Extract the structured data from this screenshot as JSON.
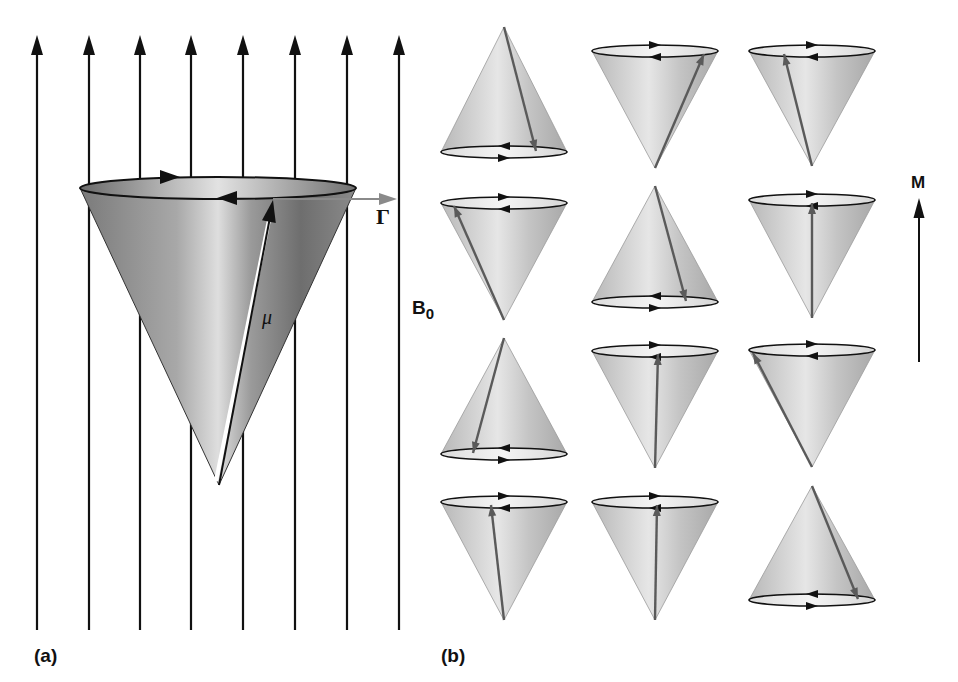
{
  "figure": {
    "panel_a": {
      "label": "(a)",
      "field_label": "B",
      "field_subscript": "0",
      "moment_label": "μ",
      "torque_label": "Γ",
      "field_lines_x": [
        37,
        89,
        140,
        191,
        243,
        295,
        347,
        399
      ],
      "field_line_top": 35,
      "field_line_bottom": 630,
      "cone": {
        "rim_cx": 218,
        "rim_cy": 188,
        "rim_rx": 138,
        "rim_ry": 11,
        "apex_x": 219,
        "apex_y": 485,
        "mu_tip_x": 273,
        "mu_tip_y": 198,
        "torque_end_x": 397
      }
    },
    "panel_b": {
      "label": "(b)",
      "net_label": "M",
      "cones": [
        {
          "id": "r1c1",
          "cx": 504,
          "orientation": "apex-up",
          "top": 27,
          "bottom": 158,
          "rx": 63,
          "vector_side": "right",
          "vector_offset": 32
        },
        {
          "id": "r1c2",
          "cx": 655,
          "orientation": "apex-down",
          "top": 45,
          "bottom": 168,
          "rx": 63,
          "vector_side": "right",
          "vector_offset": 49
        },
        {
          "id": "r1c3",
          "cx": 812,
          "orientation": "apex-down",
          "top": 45,
          "bottom": 166,
          "rx": 63,
          "vector_side": "left",
          "vector_offset": -28
        },
        {
          "id": "r2c1",
          "cx": 504,
          "orientation": "apex-down",
          "top": 197,
          "bottom": 320,
          "rx": 63,
          "vector_side": "left",
          "vector_offset": -50
        },
        {
          "id": "r2c2",
          "cx": 655,
          "orientation": "apex-up",
          "top": 186,
          "bottom": 308,
          "rx": 63,
          "vector_side": "right",
          "vector_offset": 31
        },
        {
          "id": "r2c3",
          "cx": 812,
          "orientation": "apex-down",
          "top": 194,
          "bottom": 318,
          "rx": 63,
          "vector_side": "center",
          "vector_offset": 0
        },
        {
          "id": "r3c1",
          "cx": 504,
          "orientation": "apex-up",
          "top": 338,
          "bottom": 460,
          "rx": 63,
          "vector_side": "left",
          "vector_offset": -31
        },
        {
          "id": "r3c2",
          "cx": 655,
          "orientation": "apex-down",
          "top": 345,
          "bottom": 468,
          "rx": 63,
          "vector_side": "center",
          "vector_offset": 3
        },
        {
          "id": "r3c3",
          "cx": 812,
          "orientation": "apex-down",
          "top": 344,
          "bottom": 467,
          "rx": 63,
          "vector_side": "left",
          "vector_offset": -59
        },
        {
          "id": "r4c1",
          "cx": 504,
          "orientation": "apex-down",
          "top": 496,
          "bottom": 620,
          "rx": 63,
          "vector_side": "center",
          "vector_offset": -13
        },
        {
          "id": "r4c2",
          "cx": 655,
          "orientation": "apex-down",
          "top": 496,
          "bottom": 620,
          "rx": 63,
          "vector_side": "center",
          "vector_offset": 2
        },
        {
          "id": "r4c3",
          "cx": 812,
          "orientation": "apex-up",
          "top": 486,
          "bottom": 606,
          "rx": 63,
          "vector_side": "right",
          "vector_offset": 46
        }
      ],
      "net_arrow": {
        "x": 919,
        "top": 198,
        "bottom": 362
      }
    },
    "colors": {
      "field_line": "#111111",
      "big_cone_dark": "#6e6e6e",
      "big_cone_light": "#d9d9d9",
      "small_cone_dark": "#a9a9a9",
      "small_cone_light": "#ececec",
      "vector_gray": "#5a5a5a",
      "torque_gray": "#8a8a8a"
    }
  }
}
